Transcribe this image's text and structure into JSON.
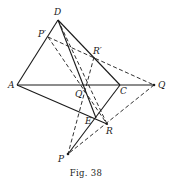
{
  "figure": {
    "caption": "Fig. 38",
    "points": {
      "D": {
        "label": "D",
        "x": 58,
        "y": 20
      },
      "P_prime": {
        "label": "P′",
        "x": 48,
        "y": 37
      },
      "R_prime": {
        "label": "R′",
        "x": 94,
        "y": 57
      },
      "A": {
        "label": "A",
        "x": 17,
        "y": 85
      },
      "Q_prime": {
        "label": "Q′",
        "x": 83,
        "y": 86
      },
      "C": {
        "label": "C",
        "x": 120,
        "y": 85
      },
      "Q": {
        "label": "Q",
        "x": 154,
        "y": 85
      },
      "E": {
        "label": "E",
        "x": 96,
        "y": 118
      },
      "R": {
        "label": "R",
        "x": 107,
        "y": 124
      },
      "P": {
        "label": "P",
        "x": 68,
        "y": 154
      }
    },
    "solid_lines": [
      [
        "D",
        "A"
      ],
      [
        "D",
        "C"
      ],
      [
        "D",
        "E"
      ],
      [
        "A",
        "Q"
      ],
      [
        "A",
        "R"
      ],
      [
        "C",
        "P"
      ]
    ],
    "dashed_lines": [
      [
        "P_prime",
        "Q"
      ],
      [
        "P_prime",
        "R"
      ],
      [
        "R_prime",
        "P"
      ],
      [
        "Q",
        "P"
      ],
      [
        "D",
        "R"
      ]
    ]
  }
}
